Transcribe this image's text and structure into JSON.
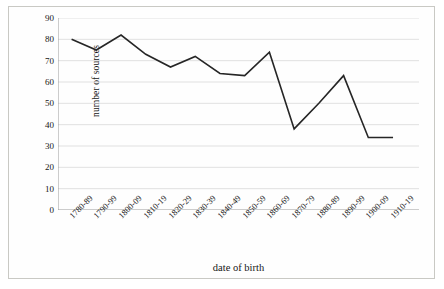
{
  "chart_data": {
    "type": "line",
    "title": "",
    "xlabel": "date of birth",
    "ylabel": "number of sources",
    "categories": [
      "1780-89",
      "1790-99",
      "1800-09",
      "1810-19",
      "1820-29",
      "1830-39",
      "1840-49",
      "1850-59",
      "1860-69",
      "1870-79",
      "1880-89",
      "1890-99",
      "1900-09",
      "1910-19"
    ],
    "values": [
      80,
      75,
      82,
      73,
      67,
      72,
      64,
      63,
      74,
      38,
      50,
      63,
      34,
      34
    ],
    "ylim": [
      0,
      90
    ],
    "ytick_labels": [
      "90",
      "80",
      "70",
      "60",
      "50",
      "40",
      "30",
      "20",
      "10",
      "0"
    ],
    "ytick_values": [
      90,
      80,
      70,
      60,
      50,
      40,
      30,
      20,
      10,
      0
    ],
    "ytick_step": 10,
    "grid": true,
    "legend": "none",
    "series_color": "#262626",
    "grid_color": "#d9d9d9",
    "axis_color": "#9a9a9a",
    "background": "#ffffff"
  }
}
